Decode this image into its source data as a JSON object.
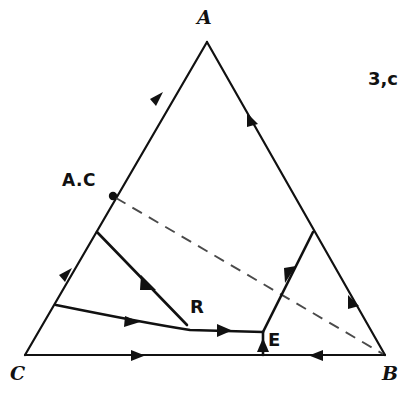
{
  "figure": {
    "caption_corner": "3,c",
    "type": "ternary-phase-diagram",
    "background_color": "#ffffff",
    "line_color": "#111111"
  },
  "vertices": {
    "top": {
      "label": "A",
      "x": 207,
      "y": 42
    },
    "bottom_left": {
      "label": "C",
      "x": 25,
      "y": 355
    },
    "bottom_right": {
      "label": "B",
      "x": 385,
      "y": 355
    }
  },
  "points": [
    {
      "name": "ac-compound",
      "label": "A.C",
      "x": 113,
      "y": 196,
      "marker": "dot"
    },
    {
      "name": "reaction-point",
      "label": "R",
      "x": 187,
      "y": 325,
      "marker": "none"
    },
    {
      "name": "eutectic-point",
      "label": "E",
      "x": 263,
      "y": 332,
      "marker": "none"
    }
  ],
  "boundary_curves": [
    {
      "name": "ac-edge-to-reaction",
      "from": "A.C side edge",
      "to": "R"
    },
    {
      "name": "c-edge-to-eutectic",
      "from": "C side edge",
      "to": "E"
    },
    {
      "name": "ab-edge-to-eutectic",
      "from": "AB edge",
      "to": "E"
    },
    {
      "name": "eutectic-to-base",
      "from": "E",
      "to": "CB base"
    }
  ],
  "dashed_line": {
    "name": "ac-b-join",
    "from": "A.C",
    "to": "B"
  },
  "arrow_count": 10
}
